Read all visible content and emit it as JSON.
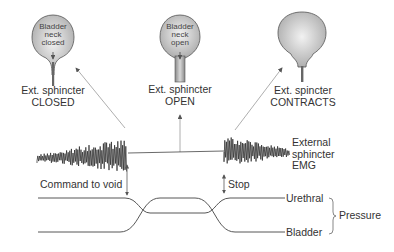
{
  "bladders": [
    {
      "inner_label_lines": [
        "Bladder",
        "neck",
        "closed"
      ],
      "caption_lines": [
        "Ext. sphincter",
        "CLOSED"
      ]
    },
    {
      "inner_label_lines": [
        "Bladder",
        "neck",
        "open"
      ],
      "caption_lines": [
        "Ext. sphincter",
        "OPEN"
      ]
    },
    {
      "inner_label_lines": [],
      "caption_lines": [
        "Ext. spincter",
        "CONTRACTS"
      ]
    }
  ],
  "emg_label_lines": [
    "External",
    "sphincter",
    "EMG"
  ],
  "events": {
    "command": "Command to void",
    "stop": "Stop"
  },
  "pressure": {
    "group_label": "Pressure",
    "urethral": "Urethral",
    "bladder": "Bladder"
  },
  "colors": {
    "line": "#444444",
    "arrow": "#999999",
    "bladder_fill_light": "#eeeeee",
    "bladder_fill_dark": "#a8a8a8"
  }
}
